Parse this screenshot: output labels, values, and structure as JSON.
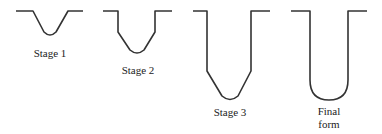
{
  "diagram": {
    "stages": [
      {
        "label": "Stage 1"
      },
      {
        "label": "Stage 2"
      },
      {
        "label": "Stage 3"
      },
      {
        "label_line1": "Final",
        "label_line2": "form"
      }
    ],
    "stroke_color": "#333333"
  }
}
